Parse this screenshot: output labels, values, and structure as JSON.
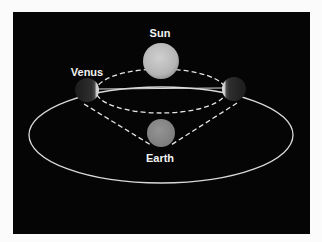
{
  "diagram": {
    "labels": {
      "sun": "Sun",
      "venus": "Venus",
      "earth": "Earth"
    },
    "colors": {
      "background": "#050505",
      "frame": "#fbfbfb",
      "orbit_line": "#d9d9d9",
      "dashed_line": "#e6e6e6",
      "sun_fill": "#bdbdbd",
      "earth_fill": "#8a8a8a",
      "venus_dark": "#2a2a2a",
      "venus_lit": "#d0d0d0",
      "label_text": "#f2f2f2"
    },
    "bodies": [
      {
        "name": "Sun",
        "cx": 161,
        "cy": 61,
        "r": 18
      },
      {
        "name": "Earth",
        "cx": 161,
        "cy": 133,
        "r": 14
      },
      {
        "name": "Venus (left)",
        "cx": 87,
        "cy": 90,
        "r": 12,
        "lit_side": "right"
      },
      {
        "name": "Venus (right)",
        "cx": 234,
        "cy": 89,
        "r": 12,
        "lit_side": "left"
      }
    ]
  }
}
